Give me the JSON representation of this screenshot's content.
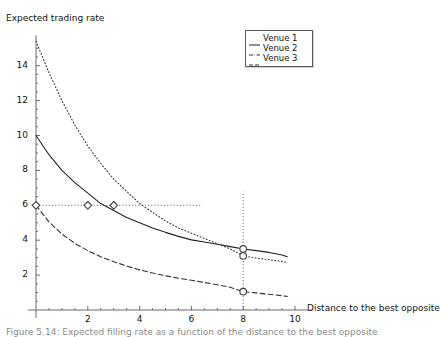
{
  "figure": {
    "ylabel": "Expected trading rate",
    "xlabel": "Distance to the best opposite",
    "caption": "Figure 5.14: Expected filling rate as a function of the distance to the best opposite"
  },
  "legend": {
    "position": "top-right",
    "entries": [
      {
        "label": "Venue 1",
        "style": "solid",
        "key": "solid-line-key"
      },
      {
        "label": "Venue 2",
        "style": "dashdot",
        "key": "dashdot-line-key"
      },
      {
        "label": "Venue 3",
        "style": "dashed",
        "key": "dashed-line-key"
      }
    ]
  },
  "axes": {
    "x_ticks": [
      "2",
      "4",
      "6",
      "8",
      "10"
    ],
    "y_ticks": [
      "2",
      "4",
      "6",
      "8",
      "10",
      "12",
      "14"
    ]
  },
  "chart_data": {
    "type": "line",
    "title": "",
    "xlabel": "Distance to the best opposite",
    "ylabel": "Expected trading rate",
    "xlim": [
      0,
      10.6
    ],
    "ylim": [
      0,
      15.4
    ],
    "xticks": [
      2,
      4,
      6,
      8,
      10
    ],
    "yticks": [
      2,
      4,
      6,
      8,
      10,
      12,
      14
    ],
    "grid": false,
    "legend_position": "top-right",
    "x": [
      0,
      0.5,
      1,
      1.5,
      2,
      2.5,
      3,
      3.5,
      4,
      4.5,
      5,
      5.5,
      6,
      6.5,
      7,
      7.5,
      8,
      8.5,
      9,
      9.5,
      9.7
    ],
    "series": [
      {
        "name": "Venue 1",
        "style": "solid",
        "color": "#222222",
        "values": [
          10.0,
          8.9,
          8.0,
          7.3,
          6.7,
          6.1,
          5.7,
          5.3,
          5.0,
          4.7,
          4.45,
          4.22,
          4.02,
          3.9,
          3.77,
          3.63,
          3.5,
          3.4,
          3.3,
          3.15,
          3.05
        ]
      },
      {
        "name": "Venue 2",
        "style": "dashdot",
        "color": "#333333",
        "values": [
          15.4,
          13.6,
          12.0,
          10.6,
          9.4,
          8.4,
          7.5,
          6.8,
          6.1,
          5.6,
          5.1,
          4.7,
          4.4,
          4.1,
          3.8,
          3.5,
          3.1,
          2.98,
          2.88,
          2.78,
          2.72
        ]
      },
      {
        "name": "Venue 3",
        "style": "dashed",
        "color": "#333333",
        "values": [
          6.0,
          5.05,
          4.35,
          3.82,
          3.4,
          3.05,
          2.77,
          2.52,
          2.3,
          2.12,
          1.96,
          1.82,
          1.7,
          1.58,
          1.45,
          1.3,
          1.05,
          0.98,
          0.9,
          0.82,
          0.78
        ]
      }
    ],
    "guides": [
      {
        "type": "hline",
        "value": 6,
        "style": "dotted",
        "x_from": 0,
        "x_to": 6.4
      },
      {
        "type": "vline",
        "value": 8,
        "style": "dotted",
        "y_from": 0,
        "y_to": 6.8
      }
    ],
    "markers": [
      {
        "shape": "diamond",
        "x": 0,
        "y": 6.0,
        "series": "Venue 3"
      },
      {
        "shape": "diamond",
        "x": 2,
        "y": 6.0,
        "series": "Venue 1"
      },
      {
        "shape": "diamond",
        "x": 3,
        "y": 6.0,
        "series": "Venue 2"
      },
      {
        "shape": "circle",
        "x": 8,
        "y": 3.5,
        "series": "Venue 1"
      },
      {
        "shape": "circle",
        "x": 8,
        "y": 3.1,
        "series": "Venue 2"
      },
      {
        "shape": "circle",
        "x": 8,
        "y": 1.05,
        "series": "Venue 3"
      }
    ]
  }
}
